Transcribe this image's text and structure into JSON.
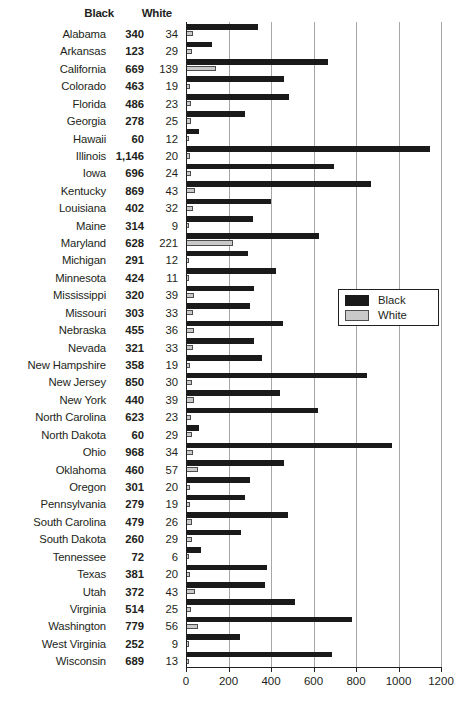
{
  "table": {
    "header_black": "Black",
    "header_white": "White"
  },
  "legend": {
    "position": "inside-right",
    "items": [
      {
        "label": "Black",
        "color": "#1a1a1a",
        "swatch": "black-swatch"
      },
      {
        "label": "White",
        "color": "#c9c9c9",
        "swatch": "white-swatch"
      }
    ]
  },
  "axis": {
    "ticks": [
      "0",
      "200",
      "400",
      "600",
      "800",
      "1000",
      "1200"
    ]
  },
  "chart_data": {
    "type": "bar",
    "orientation": "horizontal",
    "title": "",
    "xlabel": "",
    "ylabel": "",
    "xlim": [
      0,
      1200
    ],
    "xticks": [
      0,
      200,
      400,
      600,
      800,
      1000,
      1200
    ],
    "grid": true,
    "legend_position": "inside-right",
    "categories": [
      "Alabama",
      "Arkansas",
      "California",
      "Colorado",
      "Florida",
      "Georgia",
      "Hawaii",
      "Illinois",
      "Iowa",
      "Kentucky",
      "Louisiana",
      "Maine",
      "Maryland",
      "Michigan",
      "Minnesota",
      "Mississippi",
      "Missouri",
      "Nebraska",
      "Nevada",
      "New Hampshire",
      "New Jersey",
      "New York",
      "North Carolina",
      "North Dakota",
      "Ohio",
      "Oklahoma",
      "Oregon",
      "Pennsylvania",
      "South Carolina",
      "South Dakota",
      "Tennessee",
      "Texas",
      "Utah",
      "Virginia",
      "Washington",
      "West Virginia",
      "Wisconsin"
    ],
    "series": [
      {
        "name": "Black",
        "color": "#1a1a1a",
        "values": [
          340,
          123,
          669,
          463,
          486,
          278,
          60,
          1146,
          696,
          869,
          402,
          314,
          628,
          291,
          424,
          320,
          303,
          455,
          321,
          358,
          850,
          440,
          623,
          60,
          968,
          460,
          301,
          279,
          479,
          260,
          72,
          381,
          372,
          514,
          779,
          252,
          689
        ],
        "labels": [
          "340",
          "123",
          "669",
          "463",
          "486",
          "278",
          "60",
          "1,146",
          "696",
          "869",
          "402",
          "314",
          "628",
          "291",
          "424",
          "320",
          "303",
          "455",
          "321",
          "358",
          "850",
          "440",
          "623",
          "60",
          "968",
          "460",
          "301",
          "279",
          "479",
          "260",
          "72",
          "381",
          "372",
          "514",
          "779",
          "252",
          "689"
        ]
      },
      {
        "name": "White",
        "color": "#c9c9c9",
        "values": [
          34,
          29,
          139,
          19,
          23,
          25,
          12,
          20,
          24,
          43,
          32,
          9,
          221,
          12,
          11,
          39,
          33,
          36,
          33,
          19,
          30,
          39,
          23,
          29,
          34,
          57,
          20,
          19,
          26,
          29,
          6,
          20,
          43,
          25,
          56,
          9,
          13
        ],
        "labels": [
          "34",
          "29",
          "139",
          "19",
          "23",
          "25",
          "12",
          "20",
          "24",
          "43",
          "32",
          "9",
          "221",
          "12",
          "11",
          "39",
          "33",
          "36",
          "33",
          "19",
          "30",
          "39",
          "23",
          "29",
          "34",
          "57",
          "20",
          "19",
          "26",
          "29",
          "6",
          "20",
          "43",
          "25",
          "56",
          "9",
          "13"
        ]
      }
    ]
  }
}
